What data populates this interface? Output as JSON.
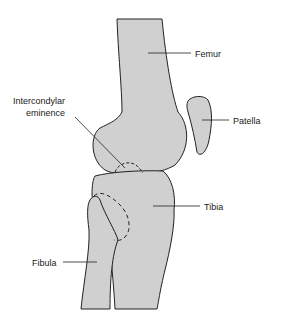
{
  "diagram": {
    "colors": {
      "bone_fill": "#d0d0d0",
      "outline": "#222222",
      "background": "#ffffff"
    },
    "labels": {
      "femur": "Femur",
      "patella": "Patella",
      "intercondylar_line1": "Intercondylar",
      "intercondylar_line2": "eminence",
      "tibia": "Tibia",
      "fibula": "Fibula"
    }
  }
}
